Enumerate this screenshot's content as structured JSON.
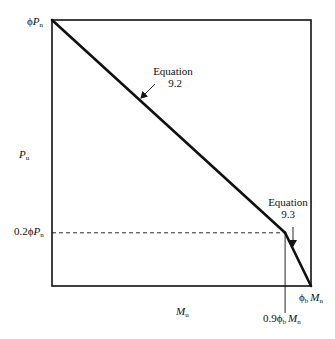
{
  "figure": {
    "type": "interaction-diagram"
  },
  "axes": {
    "y_label_main": "P",
    "y_label_sub": "u",
    "x_label_main": "M",
    "x_label_sub": "u"
  },
  "tick_labels": {
    "top_left": {
      "prefix": "ϕ",
      "main": "P",
      "sub": "n"
    },
    "y_transition": {
      "prefix": "0.2ϕ",
      "main": "P",
      "sub": "n"
    },
    "x_end": {
      "phi": "ϕ",
      "phi_sub": "b",
      "main": "M",
      "sub": "n"
    },
    "x_transition": {
      "prefix": "0.9ϕ",
      "phi_sub": "b",
      "main": "M",
      "sub": "n"
    }
  },
  "curve": {
    "points_normalized": [
      {
        "m": 0.0,
        "p": 1.0
      },
      {
        "m": 0.9,
        "p": 0.2
      },
      {
        "m": 1.0,
        "p": 0.0
      }
    ],
    "transition_p_fraction": 0.2,
    "transition_m_fraction": 0.9
  },
  "annotations": [
    {
      "line1": "Equation",
      "line2": "9.2",
      "segment": "upper"
    },
    {
      "line1": "Equation",
      "line2": "9.3",
      "segment": "lower"
    }
  ],
  "colors": {
    "ink": "#111111",
    "background": "#ffffff"
  }
}
